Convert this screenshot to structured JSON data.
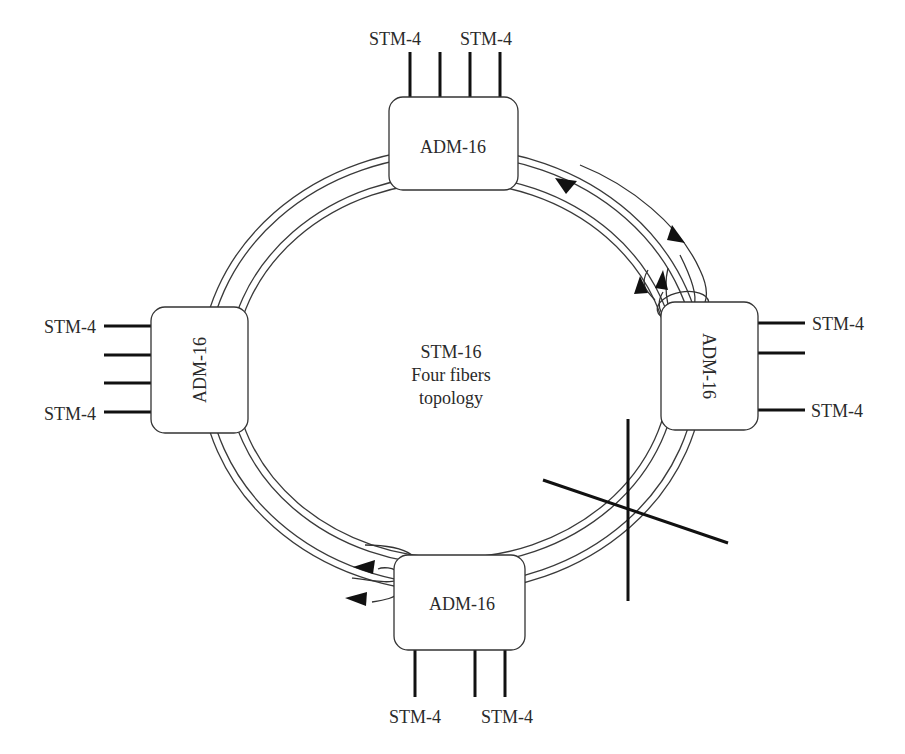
{
  "diagram": {
    "title": "STM-16",
    "subtitle_line1": "Four fibers",
    "subtitle_line2": "topology",
    "nodes": {
      "top": {
        "label": "ADM-16"
      },
      "right": {
        "label": "ADM-16"
      },
      "bottom": {
        "label": "ADM-16"
      },
      "left": {
        "label": "ADM-16"
      }
    },
    "tributaries": {
      "top": [
        "STM-4",
        "STM-4"
      ],
      "right": [
        "STM-4",
        "STM-4"
      ],
      "bottom": [
        "STM-4",
        "STM-4"
      ],
      "left": [
        "STM-4",
        "STM-4"
      ]
    },
    "fiber_break": "cut",
    "colors": {
      "line": "#333333",
      "background": "#ffffff"
    }
  }
}
